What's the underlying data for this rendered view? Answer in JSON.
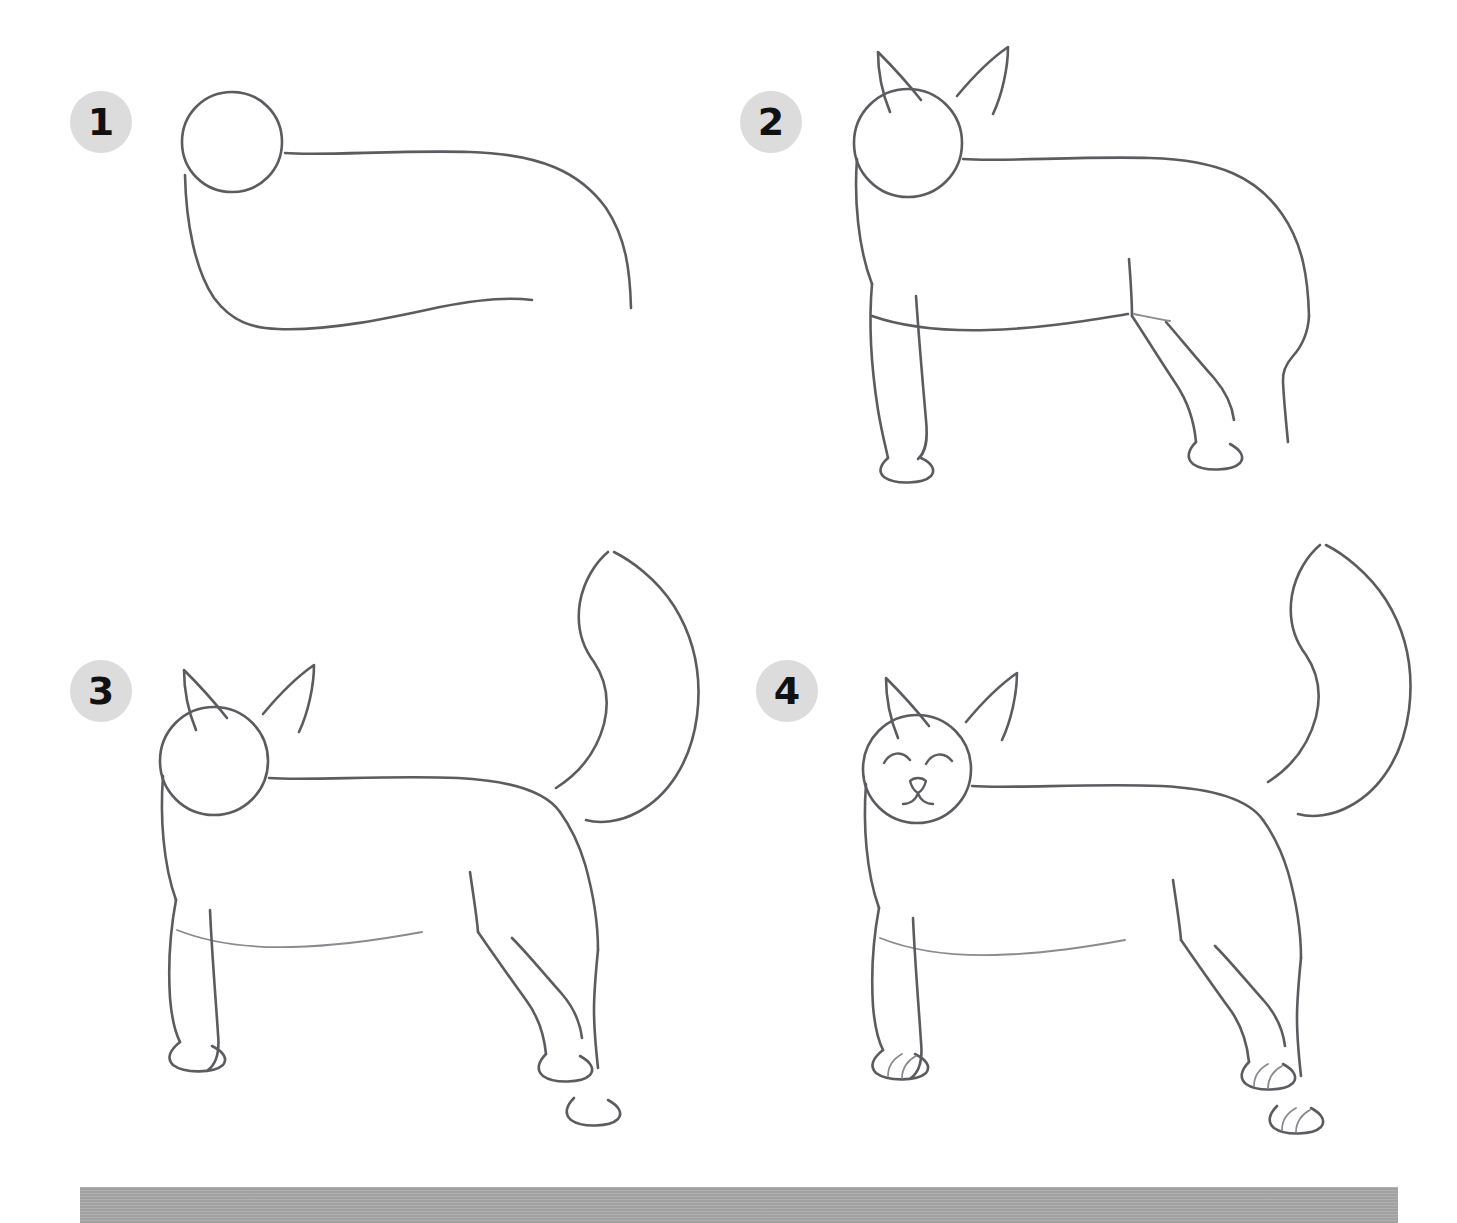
{
  "page": {
    "background_color": "#ffffff",
    "ink_color": "#5b5b60",
    "badge_color": "#dcdcdc",
    "badge_text_color": "#111111",
    "bottom_bar_color": "#a7a7a7",
    "width": 1457,
    "height": 1223
  },
  "steps": [
    {
      "number": "1",
      "badge_label": "1",
      "caption": "",
      "description": "Head circle plus curved body outline",
      "parts": [
        "head-circle",
        "body-outline",
        "belly-line"
      ]
    },
    {
      "number": "2",
      "badge_label": "2",
      "caption": "",
      "description": "Add pointed ears, four legs and rounded paws",
      "parts": [
        "head-circle",
        "ears",
        "body-outline",
        "front-legs",
        "hind-legs",
        "paws"
      ]
    },
    {
      "number": "3",
      "badge_label": "3",
      "caption": "",
      "description": "Add the long curving tail",
      "parts": [
        "head-circle",
        "ears",
        "body-outline",
        "legs",
        "paws",
        "tail"
      ]
    },
    {
      "number": "4",
      "badge_label": "4",
      "caption": "",
      "description": "Add the face: closed eyes, nose, mouth, plus paw toe lines",
      "parts": [
        "head-circle",
        "ears",
        "body-outline",
        "legs",
        "paws",
        "tail",
        "eyes",
        "nose",
        "mouth",
        "toe-lines"
      ]
    }
  ],
  "bottom_bar": {
    "label": "gray-footer-bar"
  }
}
